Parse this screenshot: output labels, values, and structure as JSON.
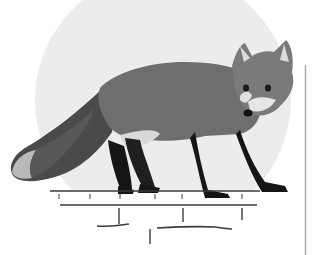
{
  "image": {
    "subject": "red fox standing in profile, head turned toward viewer",
    "style": "grayscale photograph",
    "colors": {
      "background": "#ffffff",
      "circle": "#ececec",
      "fur_body": "#6e6e6e",
      "fur_dark": "#2a2a2a",
      "legs": "#151515",
      "tail_tip": "#b9b9b9",
      "chest": "#e6e6e6",
      "lines": "#3a3a3a",
      "right_rule": "#a8a8a8"
    },
    "elements": {
      "backdrop_circle": "pale gray circle behind the fox",
      "ground_line": "horizontal line with tick marks under the fox's feet",
      "lower_line": "second horizontal line with short ticks",
      "bottom_marks": "irregular hand-drawn strokes below",
      "right_rule": "thin vertical gray line on the right edge"
    }
  }
}
